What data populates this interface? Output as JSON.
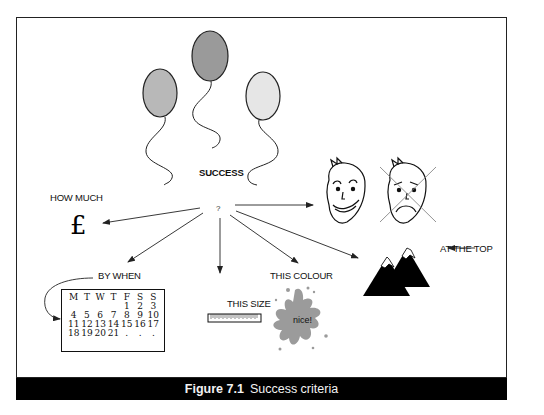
{
  "figure": {
    "number": "Figure 7.1",
    "title": "Success criteria"
  },
  "labels": {
    "success": "SUCCESS",
    "question": "?",
    "how_much": "HOW MUCH",
    "currency_symbol": "£",
    "by_when": "BY WHEN",
    "this_size": "THIS SIZE",
    "this_colour": "THIS COLOUR",
    "splat_text": "nice!",
    "at_the_top": "AT THE TOP"
  },
  "calendar": {
    "headers": [
      "M",
      "T",
      "W",
      "T",
      "F",
      "S",
      "S"
    ],
    "rows": [
      [
        "",
        "",
        "",
        "",
        "1",
        "2",
        "3"
      ],
      [
        "4",
        "5",
        "6",
        "7",
        "8",
        "9",
        "10"
      ],
      [
        "11",
        "12",
        "13",
        "14",
        "15",
        "16",
        "17"
      ],
      [
        "18",
        "19",
        "20",
        "21",
        ".",
        ".",
        "."
      ]
    ]
  },
  "icons": {
    "balloons": [
      "balloon-medium-grey",
      "balloon-dark-grey",
      "balloon-light-grey"
    ],
    "faces": [
      "happy-face",
      "sad-face-crossed-out"
    ],
    "mountains": "mountains-icon",
    "ruler": "ruler-icon",
    "paint_splat": "paint-splat-icon"
  },
  "colors": {
    "balloon_left": "#b8b8b8",
    "balloon_middle": "#9a9a9a",
    "balloon_right": "#e6e6e6",
    "splat": "#9b9b9b",
    "caption_bg": "#000000",
    "caption_text": "#f2f2f2"
  }
}
